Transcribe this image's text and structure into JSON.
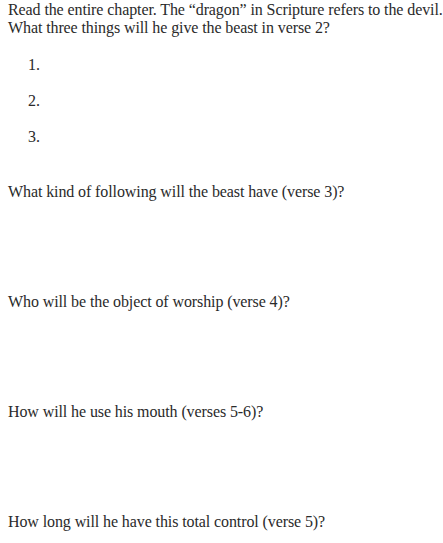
{
  "intro": {
    "line1": "Read the entire chapter. The “dragon” in Scripture refers to the devil.",
    "line2": "What three things will he give the beast in verse 2?"
  },
  "answers": [
    "1.",
    "2.",
    "3."
  ],
  "questions": [
    "What kind of following will the beast have (verse 3)?",
    "Who will be the object of worship (verse 4)?",
    "How will he use his mouth (verses 5-6)?",
    "How long will he have this total control (verse 5)?"
  ]
}
